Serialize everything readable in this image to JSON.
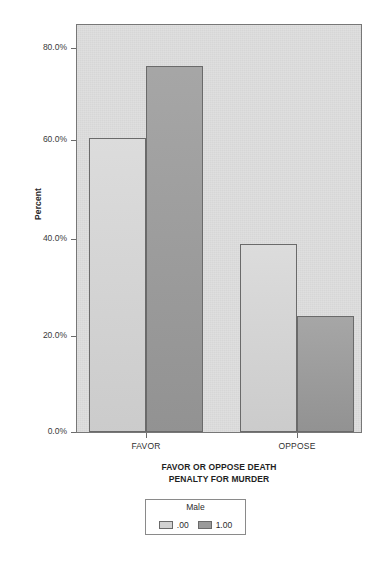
{
  "chart_data": {
    "type": "bar",
    "title": "",
    "xlabel": "FAVOR OR OPPOSE DEATH PENALTY FOR MURDER",
    "xlabel_lines": [
      "FAVOR OR OPPOSE DEATH",
      "PENALTY FOR MURDER"
    ],
    "ylabel": "Percent",
    "categories": [
      "FAVOR",
      "OPPOSE"
    ],
    "series": [
      {
        "name": ".00",
        "values": [
          61,
          39
        ],
        "color": "#d2d2d2"
      },
      {
        "name": "1.00",
        "values": [
          76,
          24
        ],
        "color": "#9a9a9a"
      }
    ],
    "ylim": [
      0,
      84.5
    ],
    "yticks": [
      0,
      20,
      40,
      60,
      80
    ],
    "ytick_labels": [
      "0.0%",
      "20.0%",
      "40.0%",
      "60.0%",
      "80.0%"
    ],
    "grid": false,
    "legend": {
      "title": "Male",
      "position": "bottom-center",
      "entries": [
        {
          "label": ".00",
          "color": "#d2d2d2"
        },
        {
          "label": "1.00",
          "color": "#9a9a9a"
        }
      ]
    },
    "plot_background": "#dcdcdc"
  }
}
